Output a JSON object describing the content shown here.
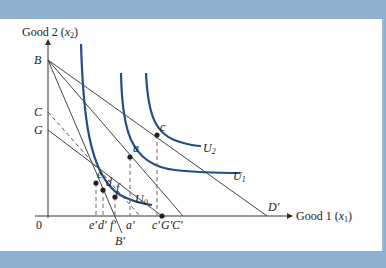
{
  "diagram": {
    "y_axis_label": "Good 2",
    "y_axis_var": "x",
    "y_axis_sub": "2",
    "x_axis_label": "Good 1",
    "x_axis_var": "x",
    "x_axis_sub": "1",
    "origin_label": "0",
    "axis_points": {
      "B": "B",
      "C": "C",
      "G": "G"
    },
    "x_labels": [
      "e'",
      "d'",
      "f'",
      "a'",
      "c'",
      "G'",
      "C'"
    ],
    "B_prime": "B'",
    "D_prime": "D'",
    "points": [
      "e",
      "d",
      "f",
      "a",
      "c"
    ],
    "curves": [
      {
        "name": "U",
        "sub": "0"
      },
      {
        "name": "U",
        "sub": "1"
      },
      {
        "name": "U",
        "sub": "2"
      }
    ],
    "colors": {
      "curve": "#1f4e8a",
      "line": "#333333",
      "frame": "#8fb1d1"
    }
  }
}
